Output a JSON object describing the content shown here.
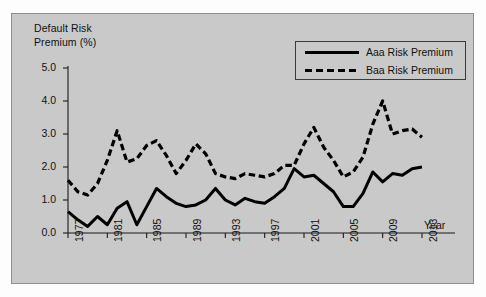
{
  "chart_data": {
    "type": "line",
    "title": "",
    "ylabel": "Default Risk\nPremium (%)",
    "xlabel": "Year",
    "ylim": [
      0.0,
      5.4
    ],
    "xlim": [
      1977,
      2013
    ],
    "grid": false,
    "legend_position": "top-right",
    "ytick_labels": [
      "0.0",
      "1.0",
      "2.0",
      "3.0",
      "4.0",
      "5.0"
    ],
    "ytick_values": [
      0.0,
      1.0,
      2.0,
      3.0,
      4.0,
      5.0
    ],
    "xtick_labels": [
      "1977",
      "1981",
      "1985",
      "1989",
      "1993",
      "1997",
      "2001",
      "2005",
      "2009",
      "2013"
    ],
    "xtick_values": [
      1977,
      1981,
      1985,
      1989,
      1993,
      1997,
      2001,
      2005,
      2009,
      2013
    ],
    "x": [
      1977,
      1978,
      1979,
      1980,
      1981,
      1982,
      1983,
      1984,
      1985,
      1986,
      1987,
      1988,
      1989,
      1990,
      1991,
      1992,
      1993,
      1994,
      1995,
      1996,
      1997,
      1998,
      1999,
      2000,
      2001,
      2002,
      2003,
      2004,
      2005,
      2006,
      2007,
      2008,
      2009,
      2010,
      2011,
      2012,
      2013
    ],
    "series": [
      {
        "name": "Aaa Risk Premium",
        "style": "solid",
        "color": "#000000",
        "values": [
          0.65,
          0.4,
          0.2,
          0.5,
          0.25,
          0.75,
          0.95,
          0.25,
          0.8,
          1.35,
          1.1,
          0.9,
          0.8,
          0.85,
          1.0,
          1.35,
          1.0,
          0.85,
          1.05,
          0.95,
          0.9,
          1.1,
          1.35,
          1.95,
          1.7,
          1.75,
          1.5,
          1.25,
          0.8,
          0.8,
          1.2,
          1.85,
          1.55,
          1.8,
          1.75,
          1.95,
          2.0
        ]
      },
      {
        "name": "Baa Risk Premium",
        "style": "dashed",
        "color": "#000000",
        "values": [
          1.6,
          1.25,
          1.15,
          1.5,
          2.2,
          3.1,
          2.15,
          2.25,
          2.65,
          2.8,
          2.35,
          1.8,
          2.2,
          2.7,
          2.4,
          1.8,
          1.7,
          1.65,
          1.8,
          1.75,
          1.7,
          1.8,
          2.05,
          2.05,
          2.7,
          3.2,
          2.6,
          2.2,
          1.7,
          1.85,
          2.3,
          3.3,
          4.0,
          3.0,
          3.1,
          3.15,
          2.9
        ]
      }
    ]
  },
  "legend": {
    "entries": [
      {
        "label": "Aaa Risk Premium"
      },
      {
        "label": "Baa Risk Premium"
      }
    ]
  }
}
